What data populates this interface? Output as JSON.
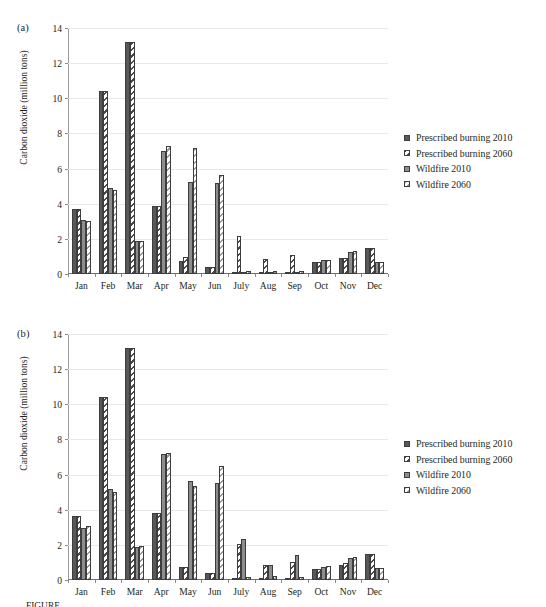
{
  "figure": {
    "caption": "FIGURE"
  },
  "legend": {
    "position": "right",
    "entries": [
      {
        "label": "Prescribed burning 2010",
        "swatch": "solid-dark-gray",
        "color": "#58585a"
      },
      {
        "label": "Prescribed burning 2060",
        "swatch": "diagonal-hatch-dark",
        "color": "#4a4a4c"
      },
      {
        "label": "Wildfire 2010",
        "swatch": "solid-mid-gray",
        "color": "#8d8d8f"
      },
      {
        "label": "Wildfire 2060",
        "swatch": "diagonal-hatch-light",
        "color": "#9a9a9c"
      }
    ]
  },
  "chart_data": [
    {
      "type": "bar",
      "panel": "(a)",
      "title": "",
      "xlabel": "",
      "ylabel": "Carbon dioxide (million tons)",
      "ylim": [
        0,
        14
      ],
      "yticks": [
        0,
        2,
        4,
        6,
        8,
        10,
        12,
        14
      ],
      "grid": true,
      "legend_position": "right",
      "categories": [
        "Jan",
        "Feb",
        "Mar",
        "Apr",
        "May",
        "Jun",
        "July",
        "Aug",
        "Sep",
        "Oct",
        "Nov",
        "Dec"
      ],
      "series": [
        {
          "name": "Prescribed burning 2010",
          "values": [
            3.7,
            10.4,
            13.2,
            3.85,
            0.75,
            0.4,
            0.05,
            0.05,
            0.05,
            0.7,
            0.9,
            1.5
          ]
        },
        {
          "name": "Prescribed burning 2060",
          "values": [
            3.7,
            10.4,
            13.2,
            3.85,
            0.95,
            0.4,
            2.15,
            0.85,
            1.1,
            0.7,
            0.9,
            1.5
          ]
        },
        {
          "name": "Wildfire 2010",
          "values": [
            3.05,
            4.9,
            1.9,
            7.0,
            5.25,
            5.2,
            0.05,
            0.05,
            0.05,
            0.8,
            1.25,
            0.7
          ]
        },
        {
          "name": "Wildfire 2060",
          "values": [
            3.0,
            4.8,
            1.9,
            7.3,
            7.2,
            5.65,
            0.15,
            0.2,
            0.15,
            0.8,
            1.3,
            0.7
          ]
        }
      ]
    },
    {
      "type": "bar",
      "panel": "(b)",
      "title": "",
      "xlabel": "",
      "ylabel": "Carbon dioxide (million tons)",
      "ylim": [
        0,
        14
      ],
      "yticks": [
        0,
        2,
        4,
        6,
        8,
        10,
        12,
        14
      ],
      "grid": true,
      "legend_position": "right",
      "categories": [
        "Jan",
        "Feb",
        "Mar",
        "Apr",
        "May",
        "Jun",
        "July",
        "Aug",
        "Sep",
        "Oct",
        "Nov",
        "Dec"
      ],
      "series": [
        {
          "name": "Prescribed burning 2010",
          "values": [
            3.65,
            10.4,
            13.2,
            3.8,
            0.75,
            0.4,
            0.05,
            0.05,
            0.05,
            0.65,
            0.85,
            1.5
          ]
        },
        {
          "name": "Prescribed burning 2060",
          "values": [
            3.65,
            10.4,
            13.2,
            3.8,
            0.75,
            0.4,
            2.05,
            0.85,
            1.05,
            0.65,
            0.95,
            1.5
          ]
        },
        {
          "name": "Wildfire 2010",
          "values": [
            2.95,
            5.2,
            1.9,
            7.2,
            5.65,
            5.5,
            2.35,
            0.85,
            1.45,
            0.75,
            1.25,
            0.7
          ]
        },
        {
          "name": "Wildfire 2060",
          "values": [
            3.05,
            5.0,
            1.95,
            7.25,
            5.35,
            6.5,
            0.15,
            0.25,
            0.15,
            0.8,
            1.3,
            0.7
          ]
        }
      ]
    }
  ]
}
